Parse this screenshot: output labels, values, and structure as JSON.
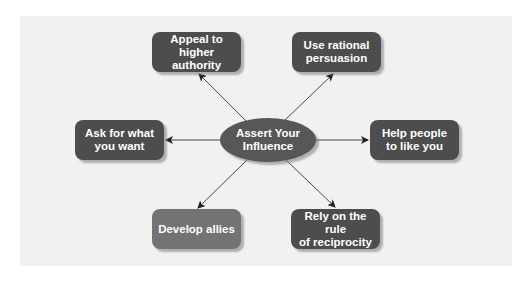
{
  "diagram": {
    "center": {
      "label": "Assert Your\nInfluence"
    },
    "nodes": [
      {
        "id": "appeal",
        "label": "Appeal to\nhigher authority",
        "style": "dark"
      },
      {
        "id": "rational",
        "label": "Use rational\npersuasion",
        "style": "dark"
      },
      {
        "id": "ask",
        "label": "Ask for what\nyou want",
        "style": "dark"
      },
      {
        "id": "help",
        "label": "Help people\nto like you",
        "style": "dark"
      },
      {
        "id": "allies",
        "label": "Develop allies",
        "style": "light"
      },
      {
        "id": "reciprocity",
        "label": "Rely on the rule\nof reciprocity",
        "style": "dark"
      }
    ],
    "edges": [
      {
        "from": "center",
        "to": "appeal"
      },
      {
        "from": "center",
        "to": "rational"
      },
      {
        "from": "center",
        "to": "ask"
      },
      {
        "from": "center",
        "to": "help"
      },
      {
        "from": "center",
        "to": "allies"
      },
      {
        "from": "center",
        "to": "reciprocity"
      }
    ]
  },
  "colors": {
    "panel_background": "#f1f1f1",
    "node_dark": "#4d4d4d",
    "node_light": "#737373",
    "center_fill": "#575757",
    "text": "#ffffff",
    "connector": "#333333"
  }
}
